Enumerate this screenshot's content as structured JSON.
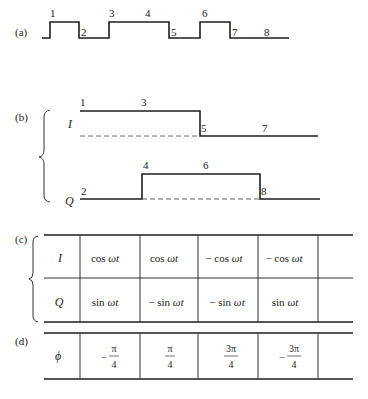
{
  "figure": {
    "panel_a": {
      "label": "(a)",
      "bit_labels": [
        "1",
        "2",
        "3",
        "4",
        "5",
        "6",
        "7",
        "8"
      ],
      "levels": [
        1,
        0,
        1,
        1,
        0,
        1,
        0,
        0
      ]
    },
    "panel_b": {
      "label": "(b)",
      "I": {
        "label": "I",
        "bit_labels": [
          "1",
          "3",
          "5",
          "7"
        ],
        "levels": [
          1,
          1,
          0,
          0
        ]
      },
      "Q": {
        "label": "Q",
        "bit_labels": [
          "2",
          "4",
          "6",
          "8"
        ],
        "levels": [
          0,
          1,
          1,
          0
        ]
      }
    },
    "panel_c": {
      "label": "(c)",
      "rows": [
        {
          "label": "I",
          "cells": [
            {
              "prefix": "cos ",
              "arg": "ωt"
            },
            {
              "prefix": "cos ",
              "arg": "ωt"
            },
            {
              "prefix": "− cos ",
              "arg": "ωt"
            },
            {
              "prefix": "− cos ",
              "arg": "ωt"
            },
            {
              "prefix": "",
              "arg": ""
            }
          ]
        },
        {
          "label": "Q",
          "cells": [
            {
              "prefix": "sin ",
              "arg": "ωt"
            },
            {
              "prefix": "− sin ",
              "arg": "ωt"
            },
            {
              "prefix": "− sin ",
              "arg": "ωt"
            },
            {
              "prefix": "sin ",
              "arg": "ωt"
            },
            {
              "prefix": "",
              "arg": ""
            }
          ]
        }
      ]
    },
    "panel_d": {
      "label": "(d)",
      "row_label": "ϕ",
      "cells": [
        {
          "sign": "−",
          "num": "π",
          "den": "4"
        },
        {
          "sign": "",
          "num": "π",
          "den": "4"
        },
        {
          "sign": "",
          "num": "3π",
          "den": "4"
        },
        {
          "sign": "−",
          "num": "3π",
          "den": "4"
        }
      ]
    }
  }
}
